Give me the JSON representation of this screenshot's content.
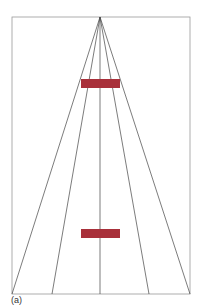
{
  "figure": {
    "label": "(a)",
    "frame": {
      "x": 12,
      "y": 17,
      "width": 178,
      "height": 277,
      "stroke": "#888888"
    },
    "apex": {
      "x": 100,
      "y": 17
    },
    "converging_lines_bottom_x": [
      12,
      52,
      100,
      149,
      190
    ],
    "bars": [
      {
        "name": "upper-bar",
        "x": 81,
        "y": 79,
        "width": 39,
        "height": 9,
        "color": "#a8303a"
      },
      {
        "name": "lower-bar",
        "x": 81,
        "y": 229,
        "width": 39,
        "height": 9,
        "color": "#a8303a"
      }
    ],
    "line_color": "#444444"
  }
}
